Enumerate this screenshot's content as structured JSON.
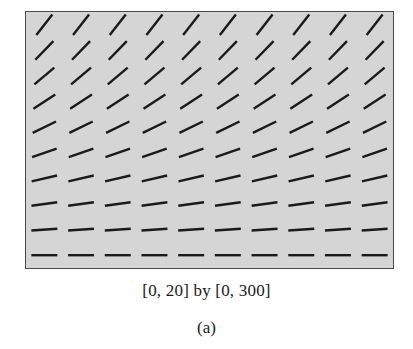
{
  "figure": {
    "caption": "[0, 20] by [0, 300]",
    "panel_label": "(a)",
    "background_color": "#ffffff",
    "plot_background_color": "#d5d5d5",
    "plot_border_color": "#4a4a4a",
    "slope_mark_color": "#1a1a1a"
  },
  "chart_data": {
    "type": "scatter",
    "subtype": "slope-field",
    "title": "",
    "subtitle": "",
    "xlabel": "",
    "ylabel": "",
    "xlim": [
      0,
      20
    ],
    "ylim": [
      0,
      300
    ],
    "grid": false,
    "legend": null,
    "annotations": [
      "[0, 20] by [0, 300]",
      "(a)"
    ],
    "x_tick_labels": [],
    "y_tick_labels": [],
    "rows": 10,
    "columns": 10,
    "x": [
      1,
      3,
      5,
      7,
      9,
      11,
      13,
      15,
      17,
      19
    ],
    "y": [
      285,
      255,
      225,
      195,
      165,
      135,
      105,
      75,
      45,
      15
    ],
    "row_slope_angles_deg": [
      52,
      46,
      40,
      33,
      26,
      19,
      13,
      8,
      4,
      0
    ],
    "mark_length_px": 26,
    "series": [
      {
        "name": "row-1",
        "y": 285,
        "angle_deg": 52
      },
      {
        "name": "row-2",
        "y": 255,
        "angle_deg": 46
      },
      {
        "name": "row-3",
        "y": 225,
        "angle_deg": 40
      },
      {
        "name": "row-4",
        "y": 195,
        "angle_deg": 33
      },
      {
        "name": "row-5",
        "y": 165,
        "angle_deg": 26
      },
      {
        "name": "row-6",
        "y": 135,
        "angle_deg": 19
      },
      {
        "name": "row-7",
        "y": 105,
        "angle_deg": 13
      },
      {
        "name": "row-8",
        "y": 75,
        "angle_deg": 8
      },
      {
        "name": "row-9",
        "y": 45,
        "angle_deg": 4
      },
      {
        "name": "row-10",
        "y": 15,
        "angle_deg": 0
      }
    ]
  }
}
